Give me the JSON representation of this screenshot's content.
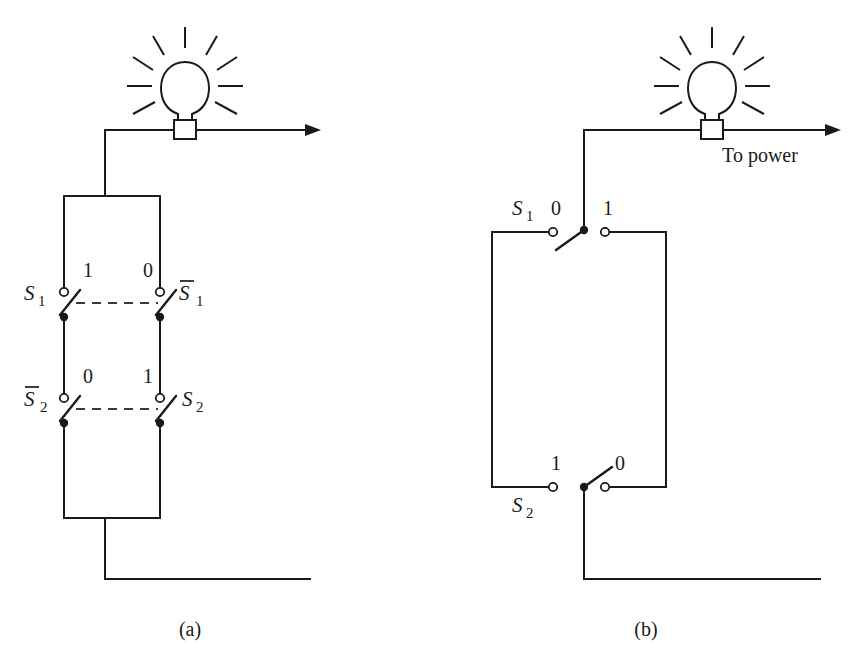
{
  "figure": {
    "background_color": "#ffffff",
    "line_color": "#1a1a1a"
  },
  "panels": [
    {
      "id": "panel-a",
      "caption": "(a)",
      "description": "Bridge arrangement of four single-pole switches driving a lamp",
      "lamp": {
        "name": "lamp",
        "rays": 9
      },
      "switches": [
        {
          "name": "S1",
          "label": "S",
          "subscript": "1",
          "overbar": false,
          "state": "1",
          "side": "left",
          "row": "top"
        },
        {
          "name": "S1b",
          "label": "S",
          "subscript": "1",
          "overbar": true,
          "state": "0",
          "side": "right",
          "row": "top"
        },
        {
          "name": "S2b",
          "label": "S",
          "subscript": "2",
          "overbar": true,
          "state": "0",
          "side": "left",
          "row": "bottom"
        },
        {
          "name": "S2",
          "label": "S",
          "subscript": "2",
          "overbar": false,
          "state": "1",
          "side": "right",
          "row": "bottom"
        }
      ],
      "ganging_lines": 2
    },
    {
      "id": "panel-b",
      "caption": "(b)",
      "description": "Equivalent circuit using two single-pole double-throw switches",
      "lamp": {
        "name": "lamp",
        "rays": 9
      },
      "power_label": "To power",
      "switches": [
        {
          "name": "S1",
          "label": "S",
          "subscript": "1",
          "overbar": false,
          "row": "top",
          "contacts": [
            "0",
            "1"
          ],
          "thrown_to": "0"
        },
        {
          "name": "S2",
          "label": "S",
          "subscript": "2",
          "overbar": false,
          "row": "bottom",
          "contacts": [
            "1",
            "0"
          ],
          "thrown_to": "0"
        }
      ]
    }
  ],
  "captions": {
    "a": "(a)",
    "b": "(b)"
  },
  "power": {
    "label": "To power"
  },
  "states": {
    "on": "1",
    "off": "0"
  }
}
